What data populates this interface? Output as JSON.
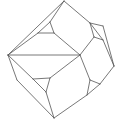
{
  "diagram": {
    "title": "",
    "stroke_color": "#555555",
    "background": "#ffffff",
    "vertices": {
      "top": [
        64,
        1
      ],
      "left": [
        8,
        55
      ],
      "bottom": [
        54,
        118
      ],
      "right": [
        114,
        66
      ],
      "center": [
        80,
        55
      ],
      "right_upper": [
        103,
        26
      ],
      "left_lower": [
        17,
        80
      ],
      "tri_ul_a": [
        50,
        22
      ],
      "tri_ul_b": [
        38,
        33
      ],
      "tri_ul_c": [
        54,
        33
      ],
      "tri_ur_a": [
        90,
        23
      ],
      "tri_ur_b": [
        94,
        37
      ],
      "tri_ur_c": [
        103,
        40
      ],
      "tri_ll_a": [
        33,
        79
      ],
      "tri_ll_b": [
        50,
        78
      ],
      "tri_ll_c": [
        46,
        92
      ],
      "tri_lr_a": [
        90,
        80
      ],
      "tri_lr_b": [
        100,
        84
      ],
      "tri_lr_c": [
        87,
        95
      ]
    },
    "edges": [
      [
        "top",
        "left"
      ],
      [
        "top",
        "tri_ur_a"
      ],
      [
        "tri_ur_a",
        "right_upper"
      ],
      [
        "right_upper",
        "right"
      ],
      [
        "left",
        "left_lower"
      ],
      [
        "left_lower",
        "bottom"
      ],
      [
        "tri_lr_b",
        "right"
      ],
      [
        "tri_lr_c",
        "bottom"
      ],
      [
        "left",
        "center"
      ],
      [
        "left",
        "tri_ll_a"
      ],
      [
        "tri_ul_a",
        "tri_ul_b"
      ],
      [
        "tri_ul_b",
        "tri_ul_c"
      ],
      [
        "tri_ul_c",
        "tri_ul_a"
      ],
      [
        "top",
        "tri_ul_a"
      ],
      [
        "tri_ul_b",
        "left"
      ],
      [
        "tri_ul_c",
        "center"
      ],
      [
        "tri_ur_a",
        "tri_ur_b"
      ],
      [
        "tri_ur_b",
        "tri_ur_c"
      ],
      [
        "tri_ur_c",
        "tri_ur_a"
      ],
      [
        "tri_ur_b",
        "center"
      ],
      [
        "tri_ur_c",
        "right"
      ],
      [
        "tri_ll_a",
        "tri_ll_b"
      ],
      [
        "tri_ll_b",
        "tri_ll_c"
      ],
      [
        "tri_ll_c",
        "tri_ll_a"
      ],
      [
        "tri_ll_b",
        "center"
      ],
      [
        "tri_ll_c",
        "bottom"
      ],
      [
        "tri_lr_a",
        "tri_lr_b"
      ],
      [
        "tri_lr_b",
        "tri_lr_c"
      ],
      [
        "tri_lr_c",
        "tri_lr_a"
      ],
      [
        "tri_lr_a",
        "center"
      ]
    ]
  }
}
